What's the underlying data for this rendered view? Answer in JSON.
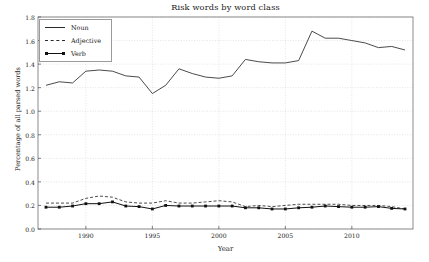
{
  "chart_data": {
    "type": "line",
    "title": "Risk words by word class",
    "xlabel": "Year",
    "ylabel": "Percentage of all parsed words",
    "xlim": [
      1986.4,
      2014.6
    ],
    "ylim": [
      0.0,
      1.8
    ],
    "xticks": [
      1990,
      1995,
      2000,
      2005,
      2010
    ],
    "xtick_labels": [
      "1990",
      "1995",
      "2000",
      "2005",
      "2010"
    ],
    "yticks": [
      0.0,
      0.2,
      0.4,
      0.6,
      0.8,
      1.0,
      1.2,
      1.4,
      1.6,
      1.8
    ],
    "ytick_labels": [
      "0.0",
      "0.2",
      "0.4",
      "0.6",
      "0.8",
      "1.0",
      "1.2",
      "1.4",
      "1.6",
      "1.8"
    ],
    "grid": true,
    "legend_position": "upper left",
    "x": [
      1987,
      1988,
      1989,
      1990,
      1991,
      1992,
      1993,
      1994,
      1995,
      1996,
      1997,
      1998,
      1999,
      2000,
      2001,
      2002,
      2003,
      2004,
      2005,
      2006,
      2007,
      2008,
      2009,
      2010,
      2011,
      2012,
      2013,
      2014
    ],
    "series": [
      {
        "name": "Noun",
        "style": "solid",
        "marker": "none",
        "color": "#2a2a2a",
        "values": [
          1.22,
          1.25,
          1.24,
          1.34,
          1.35,
          1.34,
          1.3,
          1.29,
          1.15,
          1.22,
          1.36,
          1.32,
          1.29,
          1.28,
          1.3,
          1.44,
          1.42,
          1.41,
          1.41,
          1.43,
          1.68,
          1.62,
          1.62,
          1.6,
          1.58,
          1.54,
          1.55,
          1.52
        ]
      },
      {
        "name": "Adjective",
        "style": "dashed",
        "marker": "none",
        "color": "#2a2a2a",
        "values": [
          0.22,
          0.22,
          0.22,
          0.26,
          0.28,
          0.27,
          0.23,
          0.22,
          0.22,
          0.24,
          0.22,
          0.22,
          0.23,
          0.24,
          0.23,
          0.19,
          0.2,
          0.19,
          0.2,
          0.21,
          0.21,
          0.21,
          0.21,
          0.2,
          0.2,
          0.2,
          0.19,
          0.17
        ]
      },
      {
        "name": "Verb",
        "style": "solid-marker",
        "marker": "square",
        "color": "#111111",
        "values": [
          0.185,
          0.185,
          0.195,
          0.215,
          0.215,
          0.23,
          0.195,
          0.19,
          0.17,
          0.2,
          0.195,
          0.195,
          0.195,
          0.195,
          0.195,
          0.18,
          0.18,
          0.17,
          0.17,
          0.18,
          0.185,
          0.195,
          0.19,
          0.185,
          0.185,
          0.19,
          0.175,
          0.17
        ]
      }
    ]
  },
  "legend": {
    "items": [
      {
        "label": "Noun"
      },
      {
        "label": "Adjective"
      },
      {
        "label": "Verb"
      }
    ]
  }
}
